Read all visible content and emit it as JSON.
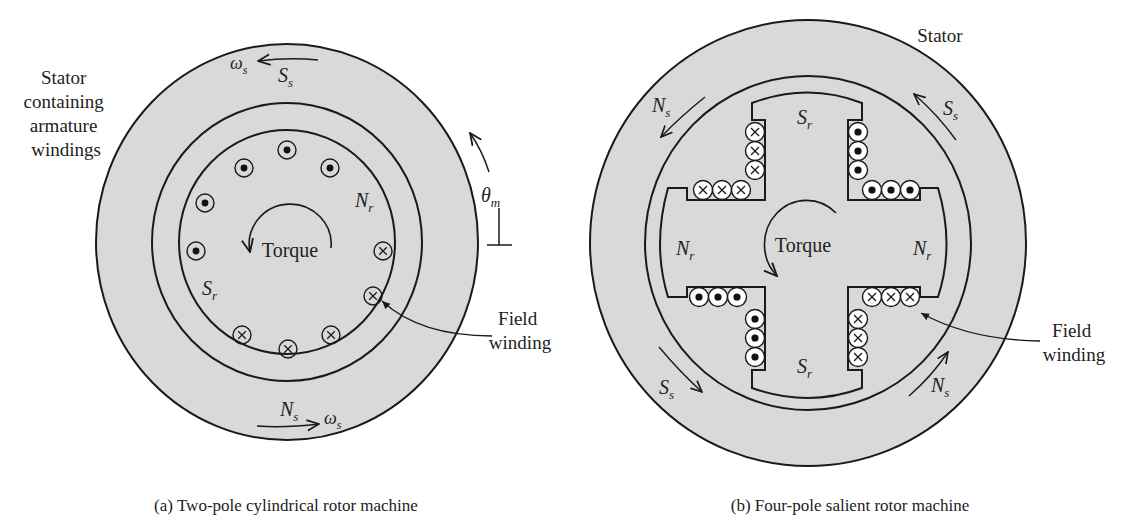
{
  "figure": {
    "colors": {
      "iron": "#d9d9d9",
      "line": "#1a1a1a",
      "background": "#ffffff"
    },
    "left": {
      "caption": "(a) Two-pole cylindrical rotor machine",
      "stator_label": [
        "Stator",
        "containing",
        "armature",
        "windings"
      ],
      "torque_label": "Torque",
      "field_label": [
        "Field",
        "winding"
      ],
      "poles": {
        "stator_south": {
          "main": "S",
          "sub": "s"
        },
        "stator_north": {
          "main": "N",
          "sub": "s"
        },
        "rotor_north": {
          "main": "N",
          "sub": "r"
        },
        "rotor_south": {
          "main": "S",
          "sub": "r"
        }
      },
      "omega_top": {
        "main": "ω",
        "sub": "s"
      },
      "omega_bottom": {
        "main": "ω",
        "sub": "s"
      },
      "theta": {
        "main": "θ",
        "sub": "m"
      },
      "conductors": [
        "dot",
        "dot",
        "dot",
        "dot",
        "dot",
        "cross",
        "cross",
        "cross",
        "cross",
        "cross"
      ]
    },
    "right": {
      "caption": "(b) Four-pole salient rotor machine",
      "stator_label": "Stator",
      "torque_label": "Torque",
      "field_label": [
        "Field",
        "winding"
      ],
      "poles": {
        "stator_ns_topleft": {
          "main": "N",
          "sub": "s"
        },
        "stator_ss_topright": {
          "main": "S",
          "sub": "s"
        },
        "stator_ss_bottomleft": {
          "main": "S",
          "sub": "s"
        },
        "stator_ns_bottomright": {
          "main": "N",
          "sub": "s"
        },
        "rotor_top": {
          "main": "S",
          "sub": "r"
        },
        "rotor_bottom": {
          "main": "S",
          "sub": "r"
        },
        "rotor_left": {
          "main": "N",
          "sub": "r"
        },
        "rotor_right": {
          "main": "N",
          "sub": "r"
        }
      },
      "coils": {
        "top_left": "cross",
        "top_right": "dot",
        "bottom_left": "dot",
        "bottom_right": "cross"
      }
    }
  }
}
